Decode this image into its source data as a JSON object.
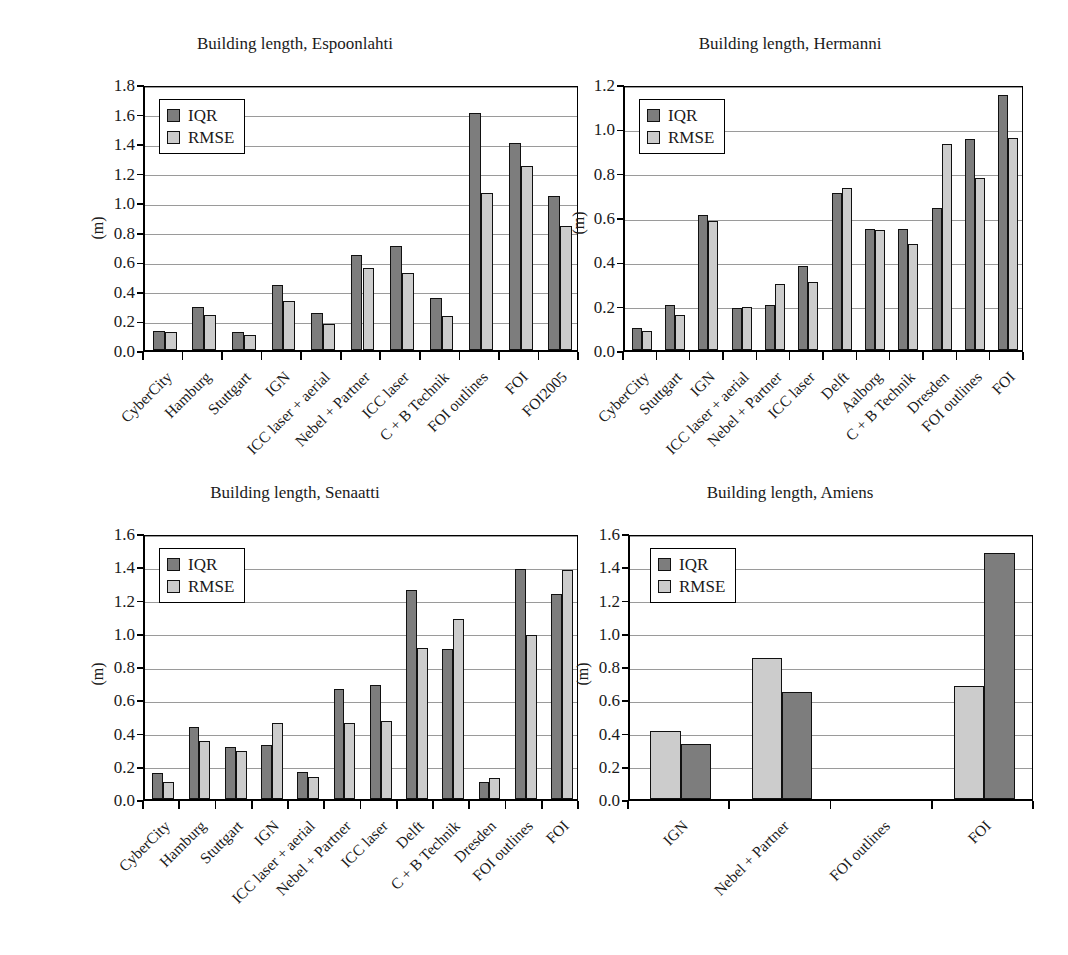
{
  "figure": {
    "panel_count": 4,
    "colors": {
      "iqr": "#7d7d7d",
      "rmse": "#cccccc",
      "axis": "#000000",
      "grid": "#9a9a9a"
    }
  },
  "chart_data": [
    {
      "type": "bar",
      "title": "Building length, Espoonlahti",
      "xlabel": "",
      "ylabel": "(m)",
      "ylim": [
        0,
        1.8
      ],
      "yticks": [
        "0.0",
        "0.2",
        "0.4",
        "0.6",
        "0.8",
        "1.0",
        "1.2",
        "1.4",
        "1.6",
        "1.8"
      ],
      "grid": true,
      "legend": [
        "IQR",
        "RMSE"
      ],
      "legend_position": "upper left",
      "series_order": [
        "IQR",
        "RMSE"
      ],
      "categories": [
        "CyberCity",
        "Hamburg",
        "Stuttgart",
        "IGN",
        "ICC laser + aerial",
        "Nebel + Partner",
        "ICC laser",
        "C + B Technik",
        "FOI outlines",
        "FOI",
        "FOI2005"
      ],
      "series": [
        {
          "name": "IQR",
          "values": [
            0.13,
            0.29,
            0.12,
            0.44,
            0.25,
            0.645,
            0.705,
            0.355,
            1.605,
            1.4,
            1.04
          ]
        },
        {
          "name": "RMSE",
          "values": [
            0.12,
            0.24,
            0.1,
            0.33,
            0.175,
            0.555,
            0.52,
            0.23,
            1.065,
            1.245,
            0.84
          ]
        }
      ]
    },
    {
      "type": "bar",
      "title": "Building length, Hermanni",
      "xlabel": "",
      "ylabel": "(m)",
      "ylim": [
        0,
        1.2
      ],
      "yticks": [
        "0.0",
        "0.2",
        "0.4",
        "0.6",
        "0.8",
        "1.0",
        "1.2"
      ],
      "grid": true,
      "legend": [
        "IQR",
        "RMSE"
      ],
      "legend_position": "upper left",
      "series_order": [
        "IQR",
        "RMSE"
      ],
      "categories": [
        "CyberCity",
        "Stuttgart",
        "IGN",
        "ICC laser + aerial",
        "Nebel + Partner",
        "ICC laser",
        "Delft",
        "Aalborg",
        "C + B Technik",
        "Dresden",
        "FOI outlines",
        "FOI"
      ],
      "series": [
        {
          "name": "IQR",
          "values": [
            0.1,
            0.205,
            0.61,
            0.19,
            0.205,
            0.38,
            0.71,
            0.545,
            0.545,
            0.64,
            0.95,
            1.15
          ]
        },
        {
          "name": "RMSE",
          "values": [
            0.085,
            0.16,
            0.58,
            0.195,
            0.3,
            0.305,
            0.73,
            0.54,
            0.48,
            0.93,
            0.775,
            0.955
          ]
        }
      ]
    },
    {
      "type": "bar",
      "title": "Building length, Senaatti",
      "xlabel": "",
      "ylabel": "(m)",
      "ylim": [
        0,
        1.6
      ],
      "yticks": [
        "0.0",
        "0.2",
        "0.4",
        "0.6",
        "0.8",
        "1.0",
        "1.2",
        "1.4",
        "1.6"
      ],
      "grid": true,
      "legend": [
        "IQR",
        "RMSE"
      ],
      "legend_position": "upper left",
      "series_order": [
        "IQR",
        "RMSE"
      ],
      "categories": [
        "CyberCity",
        "Hamburg",
        "Stuttgart",
        "IGN",
        "ICC laser + aerial",
        "Nebel + Partner",
        "ICC laser",
        "Delft",
        "C + B Technik",
        "Dresden",
        "FOI outlines",
        "FOI"
      ],
      "series": [
        {
          "name": "IQR",
          "values": [
            0.155,
            0.435,
            0.315,
            0.325,
            0.16,
            0.66,
            0.685,
            1.255,
            0.9,
            0.1,
            1.385,
            1.235
          ]
        },
        {
          "name": "RMSE",
          "values": [
            0.105,
            0.35,
            0.29,
            0.455,
            0.135,
            0.455,
            0.47,
            0.91,
            1.08,
            0.125,
            0.985,
            1.38
          ]
        }
      ]
    },
    {
      "type": "bar",
      "title": "Building length, Amiens",
      "xlabel": "",
      "ylabel": "(m)",
      "ylim": [
        0,
        1.6
      ],
      "yticks": [
        "0.0",
        "0.2",
        "0.4",
        "0.6",
        "0.8",
        "1.0",
        "1.2",
        "1.4",
        "1.6"
      ],
      "grid": true,
      "legend": [
        "IQR",
        "RMSE"
      ],
      "legend_position": "upper left",
      "series_order": [
        "RMSE",
        "IQR"
      ],
      "categories": [
        "IGN",
        "Nebel + Partner",
        "FOI outlines",
        "FOI"
      ],
      "series": [
        {
          "name": "RMSE",
          "values": [
            0.41,
            0.85,
            null,
            0.68
          ]
        },
        {
          "name": "IQR",
          "values": [
            0.33,
            0.645,
            null,
            1.48
          ]
        }
      ]
    }
  ]
}
